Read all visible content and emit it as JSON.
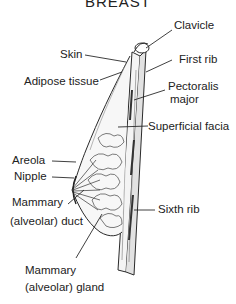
{
  "title": "BREAST",
  "labels": {
    "clavicle": "Clavicle",
    "skin": "Skin",
    "first_rib": "First rib",
    "adipose_tissue": "Adipose tissue",
    "pectoralis_1": "Pectoralis",
    "pectoralis_2": "major",
    "superficial_fascia": "Superficial facia",
    "areola": "Areola",
    "nipple": "Nipple",
    "mammary_duct_1": "Mammary",
    "mammary_duct_2": "(alveolar) duct",
    "sixth_rib": "Sixth rib",
    "mammary_gland_1": "Mammary",
    "mammary_gland_2": "(alveolar) gland"
  },
  "colors": {
    "line": "#2a2a2a",
    "shade": "#555555",
    "background": "#ffffff"
  }
}
